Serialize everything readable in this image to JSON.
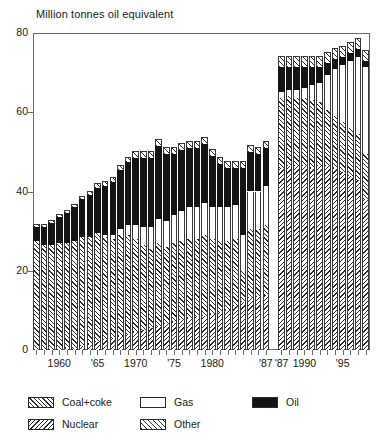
{
  "chart": {
    "type": "bar",
    "title": "Million tonnes oil equivalent",
    "ylabel": "",
    "xlabel": "",
    "ylim": [
      0,
      80
    ],
    "yticks": [
      "0",
      "20",
      "40",
      "60",
      "80"
    ],
    "xtick_labels": [
      "1960",
      "'65",
      "1970",
      "'75",
      "1980",
      "'87",
      "'87",
      "1990",
      "'95"
    ],
    "grid": false,
    "note": "Series break between the two '87 columns; left panel and right panel use different definitions",
    "legend_position": "below-plot"
  },
  "legend": {
    "items": [
      {
        "name": "coal",
        "label": "Coal+coke",
        "pattern": "forward-hatch",
        "color": "#ffffff"
      },
      {
        "name": "nuclear",
        "label": "Nuclear",
        "pattern": "back-hatch",
        "color": "#ffffff"
      },
      {
        "name": "gas",
        "label": "Gas",
        "pattern": "solid",
        "color": "#ffffff"
      },
      {
        "name": "other",
        "label": "Other",
        "pattern": "forward-hatch-wide",
        "color": "#ffffff"
      },
      {
        "name": "oil",
        "label": "Oil",
        "pattern": "solid",
        "color": "#141414"
      }
    ]
  },
  "chart_data": {
    "type": "bar",
    "stacked": true,
    "title": "Million tonnes oil equivalent",
    "xlabel": "",
    "ylabel": "Million tonnes oil equivalent",
    "ylim": [
      0,
      80
    ],
    "yticks": [
      0,
      20,
      40,
      60,
      80
    ],
    "grid": false,
    "legend": [
      "Coal+coke",
      "Nuclear",
      "Gas",
      "Other",
      "Oil"
    ],
    "series_names": [
      "coal",
      "gas",
      "oil",
      "nuclear",
      "other"
    ],
    "panels": [
      {
        "name": "left-panel",
        "categories": [
          1957,
          1958,
          1959,
          1960,
          1961,
          1962,
          1963,
          1964,
          1965,
          1966,
          1967,
          1968,
          1969,
          1970,
          1971,
          1972,
          1973,
          1974,
          1975,
          1976,
          1977,
          1978,
          1979,
          1980,
          1981,
          1982,
          1983,
          1984,
          1985,
          1986,
          1987
        ],
        "series": [
          {
            "name": "coal",
            "values": [
              27.5,
              26.5,
              26.5,
              27.0,
              26.5,
              27.0,
              27.5,
              27.0,
              27.5,
              26.0,
              25.0,
              25.5,
              25.0,
              23.5,
              21.5,
              20.0,
              21.0,
              19.5,
              20.0,
              20.0,
              20.0,
              19.5,
              20.5,
              19.0,
              18.0,
              17.5,
              17.0,
              8.0,
              17.5,
              17.0,
              17.5
            ]
          },
          {
            "name": "gas",
            "values": [
              0.0,
              0.0,
              0.0,
              0.0,
              0.0,
              0.0,
              0.0,
              0.0,
              0.0,
              0.5,
              1.0,
              1.5,
              2.5,
              3.5,
              4.5,
              5.5,
              6.0,
              6.5,
              7.0,
              7.5,
              8.0,
              8.0,
              8.0,
              8.0,
              8.5,
              8.5,
              8.5,
              9.0,
              9.5,
              9.5,
              10.0
            ]
          },
          {
            "name": "oil",
            "values": [
              3.5,
              4.5,
              5.5,
              6.5,
              7.5,
              8.5,
              9.5,
              10.5,
              11.5,
              12.5,
              13.5,
              15.0,
              16.0,
              17.0,
              17.5,
              17.5,
              18.5,
              17.0,
              15.5,
              15.5,
              15.0,
              15.0,
              15.0,
              13.0,
              11.0,
              10.0,
              9.5,
              17.0,
              10.0,
              9.5,
              9.5
            ]
          },
          {
            "name": "nuclear",
            "values": [
              0.0,
              0.0,
              0.0,
              0.0,
              0.5,
              0.5,
              1.0,
              1.5,
              2.0,
              2.5,
              3.0,
              3.5,
              4.0,
              4.5,
              5.0,
              5.5,
              6.0,
              6.5,
              7.0,
              7.5,
              8.0,
              8.5,
              8.5,
              9.0,
              9.5,
              10.0,
              11.0,
              12.0,
              13.0,
              13.5,
              14.0
            ]
          },
          {
            "name": "other",
            "values": [
              0.5,
              0.5,
              0.5,
              0.5,
              0.5,
              0.5,
              0.5,
              1.0,
              1.0,
              1.0,
              1.0,
              1.0,
              1.0,
              1.5,
              1.5,
              1.5,
              1.5,
              1.5,
              1.5,
              1.5,
              1.5,
              1.5,
              1.5,
              1.5,
              1.5,
              1.5,
              1.5,
              1.5,
              1.5,
              1.5,
              1.5
            ]
          }
        ],
        "totals": [
          31.5,
          31.5,
          32.5,
          34.0,
          35.0,
          36.5,
          38.5,
          40.0,
          42.0,
          42.5,
          43.5,
          46.5,
          48.5,
          50.0,
          50.0,
          50.0,
          53.0,
          51.0,
          51.0,
          52.0,
          52.5,
          52.5,
          53.5,
          50.5,
          48.5,
          47.5,
          47.5,
          47.5,
          51.5,
          51.0,
          52.5
        ]
      },
      {
        "name": "right-panel",
        "categories": [
          1987,
          1988,
          1989,
          1990,
          1991,
          1992,
          1993,
          1994,
          1995,
          1996,
          1997,
          1998
        ],
        "series": [
          {
            "name": "coal",
            "values": [
              17.5,
              17.5,
              17.0,
              17.0,
              17.0,
              16.0,
              14.0,
              13.0,
              12.5,
              12.0,
              11.5,
              11.5
            ]
          },
          {
            "name": "gas",
            "values": [
              1.5,
              1.5,
              2.0,
              2.5,
              4.0,
              5.0,
              9.0,
              12.0,
              14.5,
              17.0,
              19.5,
              22.0
            ]
          },
          {
            "name": "oil",
            "values": [
              6.5,
              6.0,
              6.0,
              5.5,
              4.5,
              4.0,
              3.0,
              2.5,
              2.0,
              2.0,
              2.0,
              1.5
            ]
          },
          {
            "name": "nuclear",
            "values": [
              46.0,
              46.5,
              46.5,
              46.5,
              46.0,
              46.5,
              46.5,
              46.0,
              45.0,
              44.0,
              43.0,
              38.0
            ]
          },
          {
            "name": "other",
            "values": [
              2.5,
              2.5,
              2.5,
              2.5,
              2.5,
              2.5,
              2.5,
              2.5,
              2.5,
              2.5,
              2.5,
              2.5
            ]
          }
        ],
        "totals": [
          74.0,
          74.0,
          74.0,
          74.0,
          74.0,
          74.0,
          75.0,
          76.0,
          76.5,
          77.5,
          78.5,
          75.5
        ]
      }
    ]
  }
}
